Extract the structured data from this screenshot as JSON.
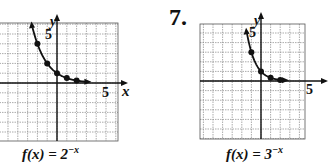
{
  "chart_data": [
    {
      "type": "line",
      "title": "f(x) = 2^-x",
      "label": "f(x) = 2",
      "exponent": "−x",
      "xlabel": "x",
      "ylabel": "y",
      "tick_label_x": "5",
      "tick_label_y": "5",
      "xlim": [
        -6,
        6
      ],
      "ylim": [
        -6,
        6
      ],
      "grid": true,
      "points": [
        {
          "x": -2,
          "y": 4
        },
        {
          "x": -1,
          "y": 2
        },
        {
          "x": 0,
          "y": 1
        },
        {
          "x": 1,
          "y": 0.5
        },
        {
          "x": 2,
          "y": 0.25
        }
      ]
    },
    {
      "type": "line",
      "number": "7.",
      "title": "f(x) = 3^-x",
      "label": "f(x) = 3",
      "exponent": "−x",
      "xlabel": "x",
      "ylabel": "y",
      "tick_label_x": "5",
      "tick_label_y": "5",
      "xlim": [
        -6,
        6
      ],
      "ylim": [
        -6,
        6
      ],
      "grid": true,
      "points": [
        {
          "x": -1,
          "y": 3
        },
        {
          "x": 0,
          "y": 1
        },
        {
          "x": 1,
          "y": 0.333
        },
        {
          "x": 2,
          "y": 0.111
        }
      ]
    }
  ]
}
